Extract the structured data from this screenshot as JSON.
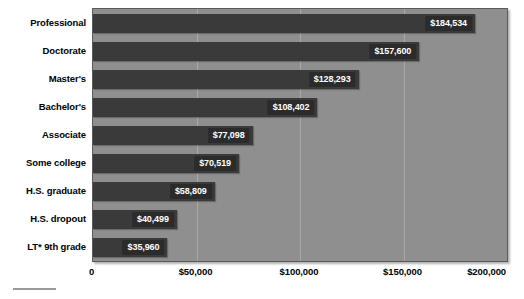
{
  "chart_data": {
    "type": "bar",
    "orientation": "horizontal",
    "title": "",
    "xlabel": "",
    "ylabel": "",
    "xlim": [
      0,
      200000
    ],
    "grid": true,
    "legend": false,
    "categories": [
      "Professional",
      "Doctorate",
      "Master's",
      "Bachelor's",
      "Associate",
      "Some college",
      "H.S. graduate",
      "H.S. dropout",
      "LT* 9th grade"
    ],
    "values": [
      184534,
      157600,
      128293,
      108402,
      77098,
      70519,
      58809,
      40499,
      35960
    ],
    "value_labels": [
      "$184,534",
      "$157,600",
      "$128,293",
      "$108,402",
      "$77,098",
      "$70,519",
      "$58,809",
      "$40,499",
      "$35,960"
    ],
    "xticks": [
      0,
      50000,
      100000,
      150000,
      200000
    ],
    "xtick_labels": [
      "0",
      "$50,000",
      "$100,000",
      "$150,000",
      "$200,000"
    ],
    "colors": {
      "bar": "#3a3a3a",
      "plot_background": "#8f8f8f",
      "value_label_background": "#2b2b2b",
      "value_label_text": "#ffffff",
      "gridline": "#a8a8a8",
      "axis_text": "#000000",
      "page_background": "#ffffff"
    }
  }
}
